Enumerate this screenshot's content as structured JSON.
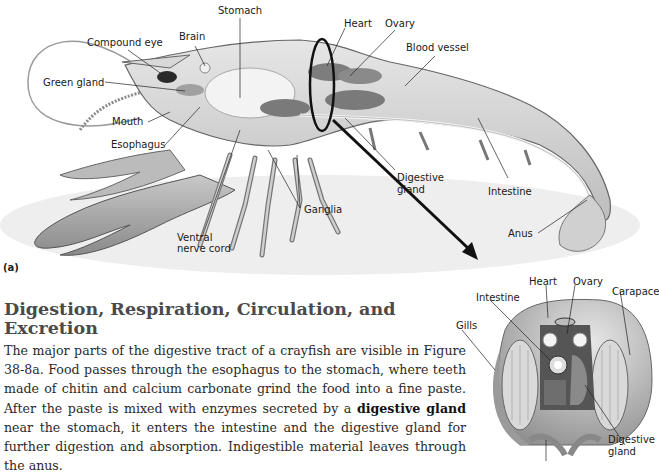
{
  "figure_a": {
    "panel_label": "(a)",
    "labels": {
      "stomach": "Stomach",
      "brain": "Brain",
      "compound_eye": "Compound eye",
      "green_gland": "Green gland",
      "mouth": "Mouth",
      "esophagus": "Esophagus",
      "heart": "Heart",
      "ovary": "Ovary",
      "blood_vessel": "Blood vessel",
      "digestive_gland_1": "Digestive",
      "digestive_gland_2": "gland",
      "intestine": "Intestine",
      "ganglia": "Ganglia",
      "ventral_1": "Ventral",
      "ventral_2": "nerve cord",
      "anus": "Anus"
    }
  },
  "figure_b": {
    "labels": {
      "heart": "Heart",
      "ovary": "Ovary",
      "carapace": "Carapace",
      "intestine": "Intestine",
      "gills": "Gills",
      "digestive_gland_1": "Digestive",
      "digestive_gland_2": "gland"
    }
  },
  "section": {
    "heading": "Digestion, Respiration, Circulation, and Excretion",
    "paragraph_part1": "The major parts of the digestive tract of a crayfish are visible in Figure 38-8a. Food passes through the esophagus to the stomach, where teeth made of chitin and calcium carbonate grind the food into a fine paste. After the paste is mixed with enzymes secreted by a ",
    "bold_term": "digestive gland",
    "paragraph_part2": " near the stomach, it enters the intestine and the digestive gland for further digestion and absorption. Indigestible material leaves through the anus."
  }
}
